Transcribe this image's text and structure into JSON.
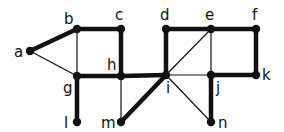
{
  "graph": {
    "nodes": [
      {
        "id": "a",
        "label": "a",
        "x": 30,
        "y": 51,
        "lx": 14,
        "ly": 57
      },
      {
        "id": "b",
        "label": "b",
        "x": 77,
        "y": 29,
        "lx": 64,
        "ly": 24
      },
      {
        "id": "c",
        "label": "c",
        "x": 121,
        "y": 29,
        "lx": 115,
        "ly": 20
      },
      {
        "id": "d",
        "label": "d",
        "x": 166,
        "y": 29,
        "lx": 160,
        "ly": 20
      },
      {
        "id": "e",
        "label": "e",
        "x": 211,
        "y": 29,
        "lx": 205,
        "ly": 20
      },
      {
        "id": "f",
        "label": "f",
        "x": 256,
        "y": 29,
        "lx": 252,
        "ly": 20
      },
      {
        "id": "g",
        "label": "g",
        "x": 77,
        "y": 76,
        "lx": 63,
        "ly": 93
      },
      {
        "id": "h",
        "label": "h",
        "x": 121,
        "y": 76,
        "lx": 107,
        "ly": 70
      },
      {
        "id": "i",
        "label": "i",
        "x": 166,
        "y": 75,
        "lx": 166,
        "ly": 93
      },
      {
        "id": "j",
        "label": "j",
        "x": 211,
        "y": 75,
        "lx": 216,
        "ly": 93
      },
      {
        "id": "k",
        "label": "k",
        "x": 256,
        "y": 75,
        "lx": 262,
        "ly": 80
      },
      {
        "id": "l",
        "label": "l",
        "x": 77,
        "y": 122,
        "lx": 64,
        "ly": 128
      },
      {
        "id": "m",
        "label": "m",
        "x": 121,
        "y": 122,
        "lx": 101,
        "ly": 128
      },
      {
        "id": "n",
        "label": "n",
        "x": 211,
        "y": 122,
        "lx": 218,
        "ly": 128
      }
    ],
    "edges": [
      {
        "from": "a",
        "to": "b",
        "thick": true
      },
      {
        "from": "a",
        "to": "g",
        "thick": false
      },
      {
        "from": "b",
        "to": "c",
        "thick": true
      },
      {
        "from": "b",
        "to": "g",
        "thick": false
      },
      {
        "from": "c",
        "to": "h",
        "thick": true
      },
      {
        "from": "g",
        "to": "h",
        "thick": true
      },
      {
        "from": "g",
        "to": "l",
        "thick": true
      },
      {
        "from": "h",
        "to": "m",
        "thick": false
      },
      {
        "from": "h",
        "to": "i",
        "thick": true
      },
      {
        "from": "m",
        "to": "i",
        "thick": true
      },
      {
        "from": "d",
        "to": "i",
        "thick": true
      },
      {
        "from": "d",
        "to": "e",
        "thick": true
      },
      {
        "from": "e",
        "to": "f",
        "thick": true
      },
      {
        "from": "e",
        "to": "i",
        "thick": false
      },
      {
        "from": "e",
        "to": "j",
        "thick": false
      },
      {
        "from": "f",
        "to": "k",
        "thick": true
      },
      {
        "from": "i",
        "to": "j",
        "thick": false
      },
      {
        "from": "j",
        "to": "k",
        "thick": true
      },
      {
        "from": "i",
        "to": "n",
        "thick": false
      },
      {
        "from": "j",
        "to": "n",
        "thick": true
      }
    ],
    "colors": {
      "stroke": "#111111",
      "node": "#111111",
      "background": "#ffffff"
    }
  }
}
